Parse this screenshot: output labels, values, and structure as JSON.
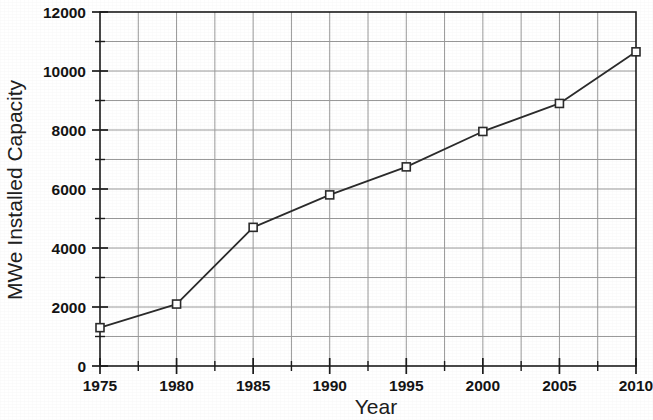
{
  "chart_data": {
    "type": "line",
    "title": "",
    "xlabel": "Year",
    "ylabel": "MWe Installed Capacity",
    "x": [
      1975,
      1980,
      1985,
      1990,
      1995,
      2000,
      2005,
      2010
    ],
    "values": [
      1300,
      2100,
      4700,
      5800,
      6750,
      7950,
      8900,
      10650
    ],
    "series": [
      {
        "name": "MWe Installed Capacity",
        "values": [
          1300,
          2100,
          4700,
          5800,
          6750,
          7950,
          8900,
          10650
        ]
      }
    ],
    "xlim": [
      1975,
      2010
    ],
    "ylim": [
      0,
      12000
    ],
    "x_major_ticks": [
      1975,
      1980,
      1985,
      1990,
      1995,
      2000,
      2005,
      2010
    ],
    "x_tick_labels": [
      "1975",
      "1980",
      "1985",
      "1990",
      "1995",
      "2000",
      "2005",
      "2010"
    ],
    "x_minor_interval": 2.5,
    "y_major_ticks": [
      0,
      2000,
      4000,
      6000,
      8000,
      10000,
      12000
    ],
    "y_tick_labels": [
      "0",
      "2000",
      "4000",
      "6000",
      "8000",
      "10000",
      "12000"
    ],
    "y_minor_ticks": [
      1000,
      3000,
      5000,
      7000,
      9000,
      11000
    ],
    "grid": true,
    "legend": null,
    "marker": "open-square",
    "line_color": "#2b2b2b",
    "grid_color": "#9a9a9a",
    "axis_color": "#1c1c1c",
    "background": "#ffffff"
  }
}
